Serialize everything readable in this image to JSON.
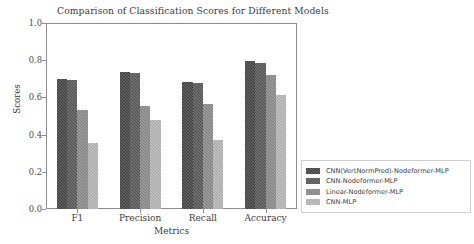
{
  "chart_data": {
    "type": "bar",
    "title": "Comparison of Classification Scores for Different Models",
    "xlabel": "Metrics",
    "ylabel": "Scores",
    "categories": [
      "F1",
      "Precision",
      "Recall",
      "Accuracy"
    ],
    "ylim": [
      0.0,
      1.0
    ],
    "yticks": [
      "0.0",
      "0.2",
      "0.4",
      "0.6",
      "0.8",
      "1.0"
    ],
    "ytick_values": [
      0.0,
      0.2,
      0.4,
      0.6,
      0.8,
      1.0
    ],
    "grid": false,
    "legend_position": "right-outside-lower",
    "series": [
      {
        "name": "CNN(VertNormPred)-Nodeformer-MLP",
        "color": "#3b3b3b",
        "values": [
          0.7,
          0.735,
          0.685,
          0.795
        ]
      },
      {
        "name": "CNN-Nodeformer-MLP",
        "color": "#4f4f4f",
        "values": [
          0.695,
          0.73,
          0.675,
          0.785
        ]
      },
      {
        "name": "Linear-Nodeformer-MLP",
        "color": "#7e7e7e",
        "values": [
          0.53,
          0.555,
          0.565,
          0.72
        ]
      },
      {
        "name": "CNN-MLP",
        "color": "#a8a8a8",
        "values": [
          0.355,
          0.48,
          0.37,
          0.615
        ]
      }
    ]
  },
  "figure": {
    "background_color": "#ffffff",
    "axis_color": "#8d8d8d"
  }
}
